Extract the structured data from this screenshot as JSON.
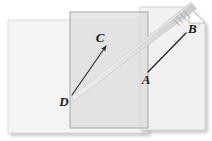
{
  "figure": {
    "background_color": "#ffffff",
    "planes": [
      {
        "name": "left-plane",
        "label": "",
        "x": 8,
        "y": 20,
        "width": 140,
        "height": 113,
        "fill": "#f3f3f3",
        "stroke": "#d8d8d8",
        "opacity": 0.95
      },
      {
        "name": "middle-plane",
        "label": "",
        "x": 70,
        "y": 12,
        "width": 78,
        "height": 116,
        "fill": "#e6e6e6",
        "stroke": "#a8a8a8",
        "opacity": 0.85
      },
      {
        "name": "right-plane",
        "label": "",
        "x": 140,
        "y": 7,
        "width": 65,
        "height": 123,
        "fill": "#f0f0f0",
        "stroke": "#cfcfcf",
        "opacity": 0.92
      }
    ],
    "page_curl": {
      "name": "folded-corner",
      "fill": "#ffffff",
      "stroke": "#b5b5b5",
      "size": 16
    },
    "shadow_color": "#d0d0d0",
    "pencil": {
      "name": "pencil-shape",
      "body_fill": "#e0e0e0",
      "body_stroke": "#c2c2c2",
      "hatch_color": "#9a9a9a",
      "tip_x": 72,
      "tip_y": 97,
      "tail_x": 196,
      "tail_y": 6
    },
    "ray": {
      "name": "ray-DC",
      "from": "D",
      "to": "C",
      "color": "#2b2b2b",
      "width": 1.2,
      "x1": 72,
      "y1": 95,
      "x2": 106,
      "y2": 46,
      "arrowhead": true
    },
    "segment": {
      "name": "segment-AB",
      "from": "A",
      "to": "B",
      "color": "#2b2b2b",
      "width": 1.4,
      "x1": 148,
      "y1": 72,
      "x2": 186,
      "y2": 33,
      "arrowhead": false
    },
    "labels": [
      {
        "name": "label-A",
        "text": "A",
        "x": 146,
        "y": 84
      },
      {
        "name": "label-B",
        "text": "B",
        "x": 188,
        "y": 33
      },
      {
        "name": "label-C",
        "text": "C",
        "x": 100,
        "y": 42
      },
      {
        "name": "label-D",
        "text": "D",
        "x": 64,
        "y": 106
      }
    ]
  }
}
